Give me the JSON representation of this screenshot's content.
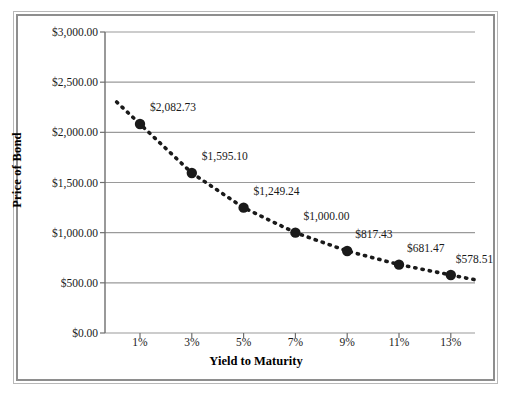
{
  "chart_data": {
    "type": "line",
    "title": "",
    "xlabel": "Yield to Maturity",
    "ylabel": "Price of Bond",
    "x": [
      1,
      3,
      5,
      7,
      9,
      11,
      13
    ],
    "categories": [
      "1%",
      "3%",
      "5%",
      "7%",
      "9%",
      "11%",
      "13%"
    ],
    "values": [
      2082.73,
      1595.1,
      1249.24,
      1000.0,
      817.43,
      681.47,
      578.51
    ],
    "point_labels": [
      "$2,082.73",
      "$1,595.10",
      "$1,249.24",
      "$1,000.00",
      "$817.43",
      "$681.47",
      "$578.51"
    ],
    "ylim": [
      0,
      3000
    ],
    "ytick_values": [
      3000,
      2500,
      2000,
      1500,
      1000,
      500,
      0
    ],
    "ytick_labels": [
      "$3,000.00",
      "$2,500.00",
      "$2,000.00",
      "$1,500.00",
      "$1,000.00",
      "$500.00",
      "$0.00"
    ],
    "xtick_labels": [
      "1%",
      "3%",
      "5%",
      "7%",
      "9%",
      "11%",
      "13%"
    ],
    "grid": "horizontal",
    "legend": "none",
    "series_style": {
      "line": "dotted",
      "line_color": "#1a1a1a",
      "marker": "circle",
      "marker_color": "#1a1a1a"
    },
    "colors": {
      "gridline": "#9a9a9a",
      "axis": "#6e6e6e",
      "frame_outer": "#b8b8b8",
      "frame_inner": "#8e8e8e",
      "text": "#1a1a1a",
      "background": "#ffffff"
    }
  }
}
